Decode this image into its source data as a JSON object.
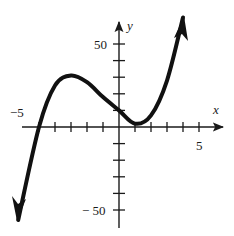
{
  "chart_data": {
    "type": "line",
    "title": "",
    "xlabel": "x",
    "ylabel": "y",
    "xlim": [
      -6.2,
      6.5
    ],
    "ylim": [
      -55,
      60
    ],
    "x_ticks_step": 1,
    "y_ticks_step": 10,
    "tick_labels": {
      "x": [
        {
          "value": -5,
          "label": "−5"
        },
        {
          "value": 5,
          "label": "5"
        }
      ],
      "y": [
        {
          "value": 50,
          "label": "50"
        },
        {
          "value": -50,
          "label": "− 50"
        }
      ]
    },
    "grid": false,
    "legend": null,
    "series": [
      {
        "name": "f(x)",
        "description": "cubic polynomial with local max near (-3, 32) and local min near (1, 0); crosses x-axis at -5",
        "arrows_at_ends": true,
        "points": [
          {
            "x": -6.3,
            "y": -56
          },
          {
            "x": -5,
            "y": 0
          },
          {
            "x": -4,
            "y": 25
          },
          {
            "x": -3,
            "y": 31
          },
          {
            "x": -2,
            "y": 27
          },
          {
            "x": -1,
            "y": 18
          },
          {
            "x": 0,
            "y": 10
          },
          {
            "x": 1,
            "y": 2
          },
          {
            "x": 2,
            "y": 7
          },
          {
            "x": 3,
            "y": 28
          },
          {
            "x": 4,
            "y": 66
          }
        ]
      }
    ]
  },
  "labels": {
    "x_axis": "x",
    "y_axis": "y",
    "x_neg5": "−5",
    "x_pos5": "5",
    "y_pos50": "50",
    "y_neg50": "− 50"
  }
}
